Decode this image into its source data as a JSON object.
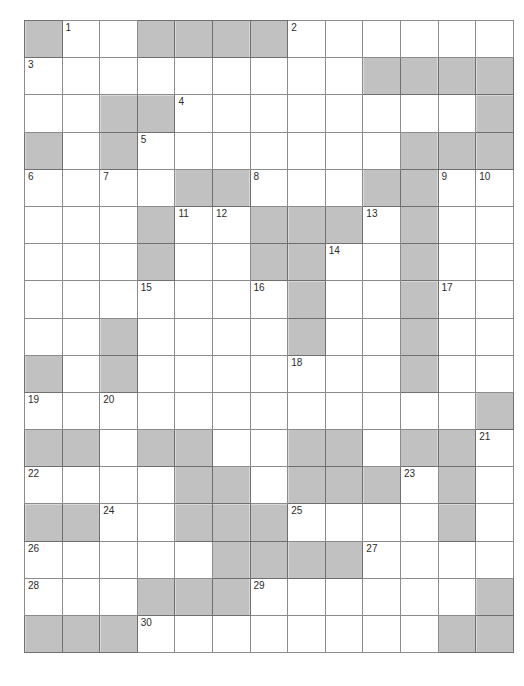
{
  "document": {
    "type": "crossword-puzzle-grid",
    "title": "",
    "columns": 13,
    "rows": 17
  },
  "colors": {
    "blocked_cell": "#8a8a8a",
    "open_cell": "#ffffff",
    "grid_line": "#8c8c8c",
    "grid_border": "#4a4a4a",
    "page_background": "#ffffff",
    "shadow": "#d8d8d8",
    "number_text": "#2b2b2b"
  },
  "grid": {
    "legend": {
      "0": "open cell (white, writable)",
      "1": "blocked cell (shaded, not writable)"
    },
    "blocked_map": [
      [
        1,
        0,
        0,
        1,
        1,
        1,
        1,
        0,
        0,
        0,
        0,
        0,
        0
      ],
      [
        0,
        0,
        0,
        0,
        0,
        0,
        0,
        0,
        0,
        1,
        1,
        1,
        1
      ],
      [
        0,
        0,
        1,
        1,
        0,
        0,
        0,
        0,
        0,
        0,
        0,
        0,
        1
      ],
      [
        1,
        0,
        1,
        0,
        0,
        0,
        0,
        0,
        0,
        0,
        1,
        1,
        1
      ],
      [
        0,
        0,
        0,
        0,
        1,
        1,
        0,
        0,
        0,
        1,
        1,
        0,
        0
      ],
      [
        0,
        0,
        0,
        1,
        0,
        0,
        1,
        1,
        1,
        0,
        1,
        0,
        0
      ],
      [
        0,
        0,
        0,
        1,
        0,
        0,
        1,
        1,
        0,
        0,
        1,
        0,
        0
      ],
      [
        0,
        0,
        0,
        0,
        0,
        0,
        0,
        1,
        0,
        0,
        1,
        0,
        0
      ],
      [
        0,
        0,
        1,
        0,
        0,
        0,
        0,
        1,
        0,
        0,
        1,
        0,
        0
      ],
      [
        1,
        0,
        1,
        0,
        0,
        0,
        0,
        0,
        0,
        0,
        1,
        0,
        0
      ],
      [
        0,
        0,
        0,
        0,
        0,
        0,
        0,
        0,
        0,
        0,
        0,
        0,
        1
      ],
      [
        1,
        1,
        0,
        1,
        1,
        0,
        0,
        1,
        1,
        0,
        1,
        1,
        0
      ],
      [
        0,
        0,
        0,
        0,
        1,
        1,
        0,
        1,
        1,
        1,
        0,
        1,
        0
      ],
      [
        1,
        1,
        0,
        0,
        1,
        1,
        1,
        0,
        0,
        0,
        0,
        1,
        0
      ],
      [
        0,
        0,
        0,
        0,
        0,
        1,
        1,
        1,
        1,
        0,
        0,
        0,
        0
      ],
      [
        0,
        0,
        0,
        1,
        1,
        1,
        0,
        0,
        0,
        0,
        0,
        0,
        1
      ],
      [
        1,
        1,
        1,
        0,
        0,
        0,
        0,
        0,
        0,
        0,
        0,
        1,
        1
      ]
    ],
    "numbers": [
      {
        "n": 1,
        "row": 0,
        "col": 1
      },
      {
        "n": 2,
        "row": 0,
        "col": 7
      },
      {
        "n": 3,
        "row": 1,
        "col": 0
      },
      {
        "n": 4,
        "row": 2,
        "col": 4
      },
      {
        "n": 5,
        "row": 3,
        "col": 3
      },
      {
        "n": 6,
        "row": 4,
        "col": 0
      },
      {
        "n": 7,
        "row": 4,
        "col": 2
      },
      {
        "n": 8,
        "row": 4,
        "col": 6
      },
      {
        "n": 9,
        "row": 4,
        "col": 11
      },
      {
        "n": 10,
        "row": 4,
        "col": 12
      },
      {
        "n": 11,
        "row": 5,
        "col": 4
      },
      {
        "n": 12,
        "row": 5,
        "col": 5
      },
      {
        "n": 13,
        "row": 5,
        "col": 9
      },
      {
        "n": 14,
        "row": 6,
        "col": 8
      },
      {
        "n": 15,
        "row": 7,
        "col": 3
      },
      {
        "n": 16,
        "row": 7,
        "col": 6
      },
      {
        "n": 17,
        "row": 7,
        "col": 11
      },
      {
        "n": 18,
        "row": 9,
        "col": 7
      },
      {
        "n": 19,
        "row": 10,
        "col": 0
      },
      {
        "n": 20,
        "row": 10,
        "col": 2
      },
      {
        "n": 21,
        "row": 11,
        "col": 12
      },
      {
        "n": 22,
        "row": 12,
        "col": 0
      },
      {
        "n": 23,
        "row": 12,
        "col": 10
      },
      {
        "n": 24,
        "row": 13,
        "col": 2
      },
      {
        "n": 25,
        "row": 13,
        "col": 7
      },
      {
        "n": 26,
        "row": 14,
        "col": 0
      },
      {
        "n": 27,
        "row": 14,
        "col": 9
      },
      {
        "n": 28,
        "row": 15,
        "col": 0
      },
      {
        "n": 29,
        "row": 15,
        "col": 6
      },
      {
        "n": 30,
        "row": 16,
        "col": 3
      }
    ],
    "letters": []
  }
}
